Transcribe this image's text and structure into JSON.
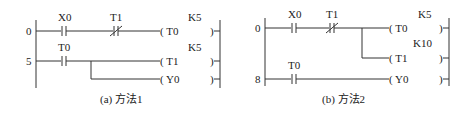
{
  "diagrams": [
    {
      "caption": "(a) 方法1",
      "rungs": [
        {
          "step": "0",
          "contacts": [
            {
              "label": "X0",
              "type": "NO"
            },
            {
              "label": "T1",
              "type": "NC"
            }
          ],
          "coils": [
            {
              "label": "( T0",
              "const": "K5"
            }
          ]
        },
        {
          "step": "5",
          "contacts": [
            {
              "label": "T0",
              "type": "NO"
            }
          ],
          "coils": [
            {
              "label": "( T1",
              "const": "K5"
            },
            {
              "label": "( Y0",
              "const": ""
            }
          ]
        }
      ]
    },
    {
      "caption": "(b) 方法2",
      "rungs": [
        {
          "step": "0",
          "contacts": [
            {
              "label": "X0",
              "type": "NO"
            },
            {
              "label": "T1",
              "type": "NC"
            }
          ],
          "coils": [
            {
              "label": "( T0",
              "const": "K5"
            },
            {
              "label": "( T1",
              "const": "K10"
            }
          ]
        },
        {
          "step": "8",
          "contacts": [
            {
              "label": "T0",
              "type": "NO"
            }
          ],
          "coils": [
            {
              "label": "( Y0",
              "const": ""
            }
          ]
        }
      ]
    }
  ],
  "coil_close": ")"
}
